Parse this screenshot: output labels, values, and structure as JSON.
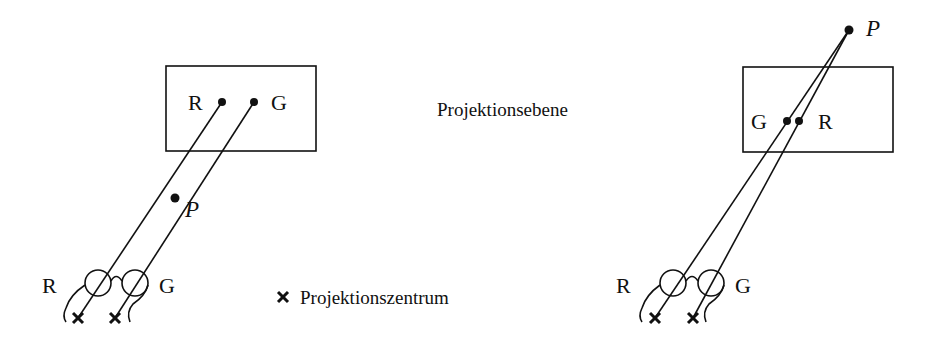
{
  "diagram": {
    "plane_label": "Projektionsebene",
    "center_legend": {
      "symbol": "×",
      "label": "Projektionszentrum"
    },
    "left_panel": {
      "plane_labels": {
        "r": "R",
        "g": "G"
      },
      "point_label": "P",
      "eye_labels": {
        "r": "R",
        "g": "G"
      }
    },
    "right_panel": {
      "plane_labels": {
        "g": "G",
        "r": "R"
      },
      "point_label": "P",
      "eye_labels": {
        "r": "R",
        "g": "G"
      }
    }
  }
}
